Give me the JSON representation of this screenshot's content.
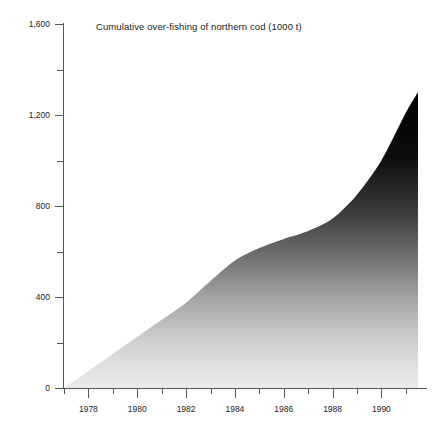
{
  "chart_data": {
    "type": "area",
    "title": "Cumulative over-fishing of northern cod (1000 t)",
    "xlabel": "",
    "ylabel": "",
    "xlim": [
      1977,
      1991.5
    ],
    "ylim": [
      0,
      1600
    ],
    "grid": false,
    "legend": null,
    "y_ticks_major": [
      0,
      400,
      800,
      1200,
      1600
    ],
    "y_ticks_minor": [
      200,
      600,
      1000,
      1400
    ],
    "y_tick_labels": [
      "0",
      "400",
      "800",
      "1,200",
      "1,600"
    ],
    "x_ticks_major": [
      1978,
      1980,
      1982,
      1984,
      1986,
      1988,
      1990
    ],
    "x_ticks_minor": [
      1977,
      1979,
      1981,
      1983,
      1985,
      1987,
      1989,
      1991
    ],
    "x_tick_labels": [
      "1978",
      "1980",
      "1982",
      "1984",
      "1986",
      "1988",
      "1990"
    ],
    "fill_style": "vertical-gradient-black-to-light-grey",
    "fill_top_color": "#000000",
    "fill_bottom_color": "#e8e8e8",
    "axis_color": "#555555",
    "series": [
      {
        "name": "Cumulative over-fishing of northern cod",
        "units": "1000 t",
        "x": [
          1977,
          1978,
          1979,
          1980,
          1981,
          1982,
          1983,
          1984,
          1985,
          1986,
          1987,
          1988,
          1989,
          1990,
          1991,
          1991.5
        ],
        "values": [
          0,
          75,
          150,
          225,
          300,
          375,
          470,
          560,
          615,
          655,
          690,
          745,
          850,
          1000,
          1210,
          1300
        ]
      }
    ]
  },
  "axes": {
    "y_labels": [
      "1,600",
      "1,200",
      "800",
      "400",
      "0"
    ],
    "x_labels": [
      "1978",
      "1980",
      "1982",
      "1984",
      "1986",
      "1988",
      "1990"
    ]
  }
}
